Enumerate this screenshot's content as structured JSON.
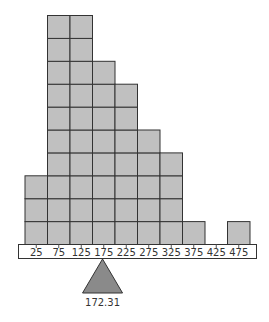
{
  "chart_data": {
    "type": "bar",
    "subtype": "dot-histogram with balance fulcrum (mean)",
    "title": "",
    "xlabel": "",
    "ylabel": "",
    "categories": [
      "25",
      "75",
      "125",
      "175",
      "225",
      "275",
      "325",
      "375",
      "425",
      "475"
    ],
    "values": [
      3,
      10,
      10,
      8,
      7,
      5,
      4,
      1,
      0,
      1
    ],
    "bin_width": 50,
    "grid": false,
    "legend": null,
    "mean_marker": {
      "value": 172.31,
      "label": "172.31",
      "shape": "triangle"
    },
    "colors": {
      "cell": "#c0c0c0",
      "outline": "#333333",
      "fulcrum": "#8a8a8a"
    }
  },
  "mean_label": "172.31"
}
